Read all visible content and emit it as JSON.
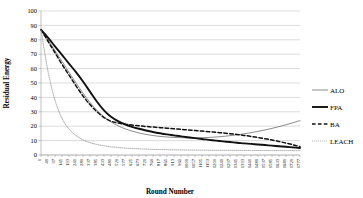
{
  "chart_data": {
    "type": "line",
    "title": "",
    "xlabel": "Round Number",
    "ylabel": "Residual Energy",
    "xlim": [
      1,
      1777
    ],
    "ylim": [
      0,
      100
    ],
    "ytick_step": 10,
    "yticks": [
      0,
      10,
      20,
      30,
      40,
      50,
      60,
      70,
      80,
      90,
      100
    ],
    "xticks": [
      1,
      49,
      97,
      145,
      193,
      241,
      289,
      337,
      385,
      433,
      481,
      529,
      577,
      625,
      673,
      721,
      769,
      817,
      865,
      913,
      961,
      1009,
      1057,
      1105,
      1153,
      1201,
      1249,
      1297,
      1345,
      1393,
      1441,
      1489,
      1537,
      1585,
      1633,
      1681,
      1729,
      1777
    ],
    "grid": true,
    "grid_axis": "y",
    "legend_position": "right",
    "x": [
      1,
      49,
      97,
      145,
      193,
      241,
      289,
      337,
      385,
      433,
      481,
      529,
      577,
      625,
      673,
      721,
      769,
      817,
      865,
      913,
      961,
      1009,
      1057,
      1105,
      1153,
      1201,
      1249,
      1297,
      1345,
      1393,
      1441,
      1489,
      1537,
      1585,
      1633,
      1681,
      1729,
      1777
    ],
    "series": [
      {
        "name": "ALO",
        "style": "solid-thin",
        "color": "#808080",
        "width": 0.9,
        "values": [
          87,
          80,
          72.5,
          65,
          57.5,
          50,
          43,
          36.5,
          31,
          26.5,
          23,
          20.3,
          18.2,
          16.6,
          15.3,
          14.3,
          13.5,
          12.9,
          12.5,
          12.2,
          12.0,
          11.9,
          11.9,
          12.0,
          12.2,
          12.5,
          12.9,
          13.4,
          14.0,
          14.7,
          15.5,
          16.4,
          17.4,
          18.5,
          19.7,
          21.0,
          22.4,
          23.9
        ]
      },
      {
        "name": "FPA",
        "style": "solid-thick",
        "color": "#111111",
        "width": 1.9,
        "values": [
          87,
          81.5,
          75.5,
          69.5,
          63.5,
          57.5,
          51,
          44,
          37,
          31,
          26.5,
          23.5,
          21.3,
          19.6,
          18.2,
          17.0,
          16.0,
          15.1,
          14.3,
          13.6,
          12.9,
          12.3,
          11.7,
          11.1,
          10.5,
          10.0,
          9.5,
          9.0,
          8.5,
          8.1,
          7.7,
          7.3,
          6.9,
          6.5,
          6.1,
          5.7,
          5.3,
          4.9
        ]
      },
      {
        "name": "BA",
        "style": "dashed",
        "color": "#111111",
        "width": 1.5,
        "values": [
          87,
          79,
          71,
          63,
          55.5,
          48,
          41,
          35,
          30,
          26,
          23.5,
          22.2,
          21.4,
          20.8,
          20.3,
          19.8,
          19.4,
          19.0,
          18.6,
          18.2,
          17.8,
          17.4,
          17.0,
          16.6,
          16.2,
          15.8,
          15.3,
          14.8,
          14.2,
          13.6,
          12.9,
          12.1,
          11.3,
          10.4,
          9.4,
          8.3,
          7.1,
          5.8
        ]
      },
      {
        "name": "LEACH",
        "style": "dotted",
        "color": "#9a9a9a",
        "width": 0.9,
        "values": [
          87,
          58,
          38,
          25.5,
          18,
          13.5,
          10.5,
          8.6,
          7.3,
          6.4,
          5.7,
          5.2,
          4.8,
          4.5,
          4.3,
          4.1,
          3.9,
          3.8,
          3.7,
          3.6,
          3.5,
          3.45,
          3.4,
          3.35,
          3.3,
          3.28,
          3.25,
          3.22,
          3.2,
          3.18,
          3.16,
          3.14,
          3.12,
          3.1,
          3.08,
          3.06,
          3.04,
          3.02
        ]
      }
    ]
  },
  "legend": {
    "items": [
      {
        "label": "ALO"
      },
      {
        "label": "FPA"
      },
      {
        "label": "BA"
      },
      {
        "label": "LEACH"
      }
    ]
  }
}
